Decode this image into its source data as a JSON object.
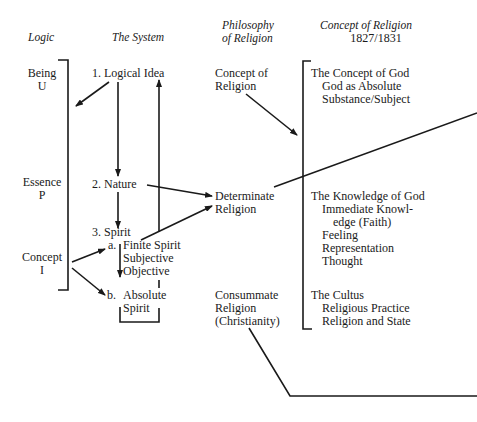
{
  "headers": {
    "logic": "Logic",
    "system": "The System",
    "philosophy_line1": "Philosophy",
    "philosophy_line2": "of Religion",
    "concept_line1": "Concept of Religion",
    "concept_line2": "1827/1831"
  },
  "logic": {
    "being": "Being",
    "being_sym": "U",
    "essence": "Essence",
    "essence_sym": "P",
    "concept": "Concept",
    "concept_sym": "I"
  },
  "system": {
    "logical_idea": "1.  Logical Idea",
    "nature": "2.  Nature",
    "spirit": "3.  Spirit",
    "a_label": "a.",
    "finite_spirit": "Finite Spirit",
    "subjective": "Subjective",
    "objective": "Objective",
    "b_label": "b.",
    "absolute": "Absolute",
    "spirit2": "Spirit"
  },
  "philosophy": {
    "concept_of": "Concept of",
    "religion1": "Religion",
    "determinate": "Determinate",
    "religion2": "Religion",
    "consummate": "Consummate",
    "religion3": "Religion",
    "christianity": "(Christianity)"
  },
  "concept_of_religion": {
    "concept_of_god": "The Concept of God",
    "god_as_absolute": "God as Absolute",
    "substance_subject": "Substance/Subject",
    "knowledge_of_god": "The Knowledge of God",
    "immediate_knowl": "Immediate Knowl-",
    "edge_faith": "edge (Faith)",
    "feeling": "Feeling",
    "representation": "Representation",
    "thought": "Thought",
    "cultus": "The Cultus",
    "religious_practice": "Religious Practice",
    "religion_and_state": "Religion and State"
  },
  "colors": {
    "ink": "#1a1a1a",
    "background": "#ffffff"
  }
}
